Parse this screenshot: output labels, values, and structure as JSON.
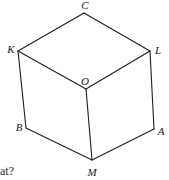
{
  "figure": {
    "name": "labeled-cube-diagram",
    "background_color": "#ffffff",
    "stroke_color": "#1e1e1e",
    "label_color": "#1a1a1a",
    "width": 169,
    "height": 180,
    "vertices": [
      {
        "id": "C",
        "label": "C",
        "x": 84,
        "y": 13,
        "label_x": 85,
        "label_y": 5
      },
      {
        "id": "K",
        "label": "K",
        "x": 18,
        "y": 51,
        "label_x": 11,
        "label_y": 49
      },
      {
        "id": "L",
        "label": "L",
        "x": 150,
        "y": 51,
        "label_x": 158,
        "label_y": 50
      },
      {
        "id": "O",
        "label": "O",
        "x": 86,
        "y": 89,
        "label_x": 85,
        "label_y": 81
      },
      {
        "id": "B",
        "label": "B",
        "x": 26,
        "y": 128,
        "label_x": 19,
        "label_y": 127
      },
      {
        "id": "A",
        "label": "A",
        "x": 154,
        "y": 129,
        "label_x": 161,
        "label_y": 131
      },
      {
        "id": "M",
        "label": "M",
        "x": 92,
        "y": 160,
        "label_x": 92,
        "label_y": 172
      }
    ],
    "edges": [
      {
        "from": "K",
        "to": "C"
      },
      {
        "from": "C",
        "to": "L"
      },
      {
        "from": "K",
        "to": "O"
      },
      {
        "from": "O",
        "to": "L"
      },
      {
        "from": "K",
        "to": "B"
      },
      {
        "from": "L",
        "to": "A"
      },
      {
        "from": "O",
        "to": "M"
      },
      {
        "from": "B",
        "to": "M"
      },
      {
        "from": "M",
        "to": "A"
      }
    ]
  },
  "caption": {
    "text": "hat?"
  }
}
